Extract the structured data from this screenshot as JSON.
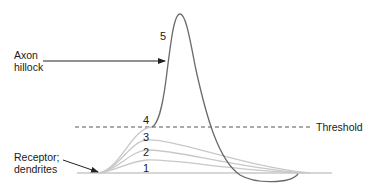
{
  "diagram": {
    "title": "",
    "labels": {
      "axon_hillock_line1": "Axon",
      "axon_hillock_line2": "hillock",
      "receptor_line1": "Receptor;",
      "receptor_line2": "dendrites",
      "threshold": "Threshold"
    },
    "curve_numbers": [
      "1",
      "2",
      "3",
      "4",
      "5"
    ],
    "curves": [
      {
        "id": "1",
        "type": "graded potential",
        "peak_relative": "lowest",
        "color": "#c8c8c8"
      },
      {
        "id": "2",
        "type": "graded potential",
        "peak_relative": "low",
        "color": "#c8c8c8"
      },
      {
        "id": "3",
        "type": "graded potential",
        "peak_relative": "medium",
        "color": "#c8c8c8"
      },
      {
        "id": "4",
        "type": "graded potential",
        "peak_relative": "reaches threshold",
        "color": "#c8c8c8"
      },
      {
        "id": "5",
        "type": "action potential",
        "peak_relative": "spike with undershoot",
        "color": "#6a6a6a"
      }
    ],
    "colors": {
      "graded": "#c8c8c8",
      "action_potential": "#6a6a6a",
      "threshold_line": "#555555",
      "baseline": "#c8c8c8",
      "arrows": "#222222",
      "text": "#1a1a1a"
    }
  }
}
